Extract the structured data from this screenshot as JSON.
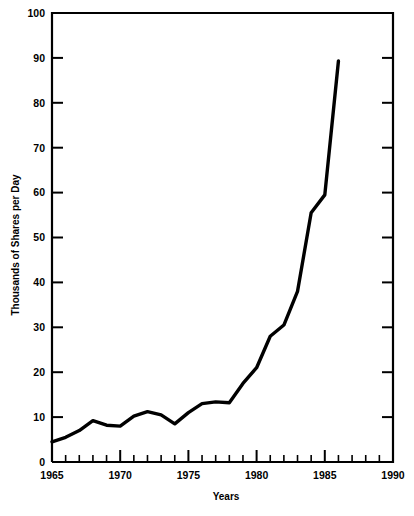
{
  "chart_data": {
    "type": "line",
    "title": "",
    "xlabel": "Years",
    "ylabel": "Thousands of Shares per Day",
    "xlim": [
      1965,
      1990
    ],
    "ylim": [
      0,
      100
    ],
    "grid": false,
    "legend": "none",
    "x_major_ticks": [
      1965,
      1970,
      1975,
      1980,
      1985,
      1990
    ],
    "x_major_tick_labels": [
      "1965",
      "1970",
      "1975",
      "1980",
      "1985",
      "1990"
    ],
    "x_minor_tick_step": 1,
    "y_major_ticks": [
      0,
      10,
      20,
      30,
      40,
      50,
      60,
      70,
      80,
      90,
      100
    ],
    "y_major_tick_labels": [
      "0",
      "10",
      "20",
      "30",
      "40",
      "50",
      "60",
      "70",
      "80",
      "90",
      "100"
    ],
    "series": [
      {
        "name": "Shares per Day",
        "color": "#000000",
        "x": [
          1965,
          1966,
          1967,
          1968,
          1969,
          1970,
          1971,
          1972,
          1973,
          1974,
          1975,
          1976,
          1977,
          1978,
          1979,
          1980,
          1981,
          1982,
          1983,
          1984,
          1985,
          1986
        ],
        "values": [
          4.5,
          5.5,
          7.0,
          9.2,
          8.2,
          8.0,
          10.2,
          11.2,
          10.5,
          8.5,
          11.0,
          13.0,
          13.4,
          13.2,
          17.5,
          21.0,
          28.0,
          30.5,
          38.0,
          55.5,
          59.5,
          89.3
        ]
      }
    ]
  },
  "labels": {
    "y_axis_title": "Thousands of Shares per Day",
    "x_axis_title": "Years"
  }
}
